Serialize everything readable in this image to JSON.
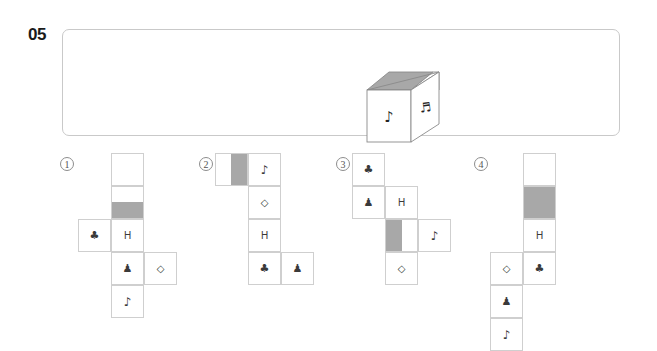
{
  "question": {
    "number": "05"
  },
  "stimulus": {
    "name": "cube-prompt",
    "cube": {
      "top_face_left_shade": "#a8a8a8",
      "top_face_right_shade": "#ffffff",
      "front_face_symbol": "♪",
      "front_face_symbol_name": "eighth-note",
      "right_face_symbol": "♬",
      "right_face_symbol_name": "beamed-notes",
      "outline_color": "#8a8a8a"
    }
  },
  "options": [
    {
      "label": "①",
      "name": "option-1",
      "cells": [
        {
          "col": 1,
          "row": 0,
          "fill": "white",
          "glyph": ""
        },
        {
          "col": 1,
          "row": 1,
          "fill": "gray-bottom",
          "glyph": ""
        },
        {
          "col": 0,
          "row": 2,
          "fill": "white",
          "glyph": "♣"
        },
        {
          "col": 1,
          "row": 2,
          "fill": "white",
          "glyph": "H"
        },
        {
          "col": 1,
          "row": 3,
          "fill": "white",
          "glyph": "♟"
        },
        {
          "col": 2,
          "row": 3,
          "fill": "white",
          "glyph": "◇"
        },
        {
          "col": 1,
          "row": 4,
          "fill": "white",
          "glyph": "♪"
        }
      ]
    },
    {
      "label": "②",
      "name": "option-2",
      "cells": [
        {
          "col": 0,
          "row": 0,
          "fill": "gray-right",
          "glyph": ""
        },
        {
          "col": 1,
          "row": 0,
          "fill": "white",
          "glyph": "♪"
        },
        {
          "col": 1,
          "row": 1,
          "fill": "white",
          "glyph": "◇"
        },
        {
          "col": 1,
          "row": 2,
          "fill": "white",
          "glyph": "H"
        },
        {
          "col": 1,
          "row": 3,
          "fill": "white",
          "glyph": "♣"
        },
        {
          "col": 2,
          "row": 3,
          "fill": "white",
          "glyph": "♟"
        }
      ]
    },
    {
      "label": "③",
      "name": "option-3",
      "cells": [
        {
          "col": 0,
          "row": 0,
          "fill": "white",
          "glyph": "♣"
        },
        {
          "col": 0,
          "row": 1,
          "fill": "white",
          "glyph": "♟"
        },
        {
          "col": 1,
          "row": 1,
          "fill": "white",
          "glyph": "H"
        },
        {
          "col": 1,
          "row": 2,
          "fill": "gray-left",
          "glyph": ""
        },
        {
          "col": 2,
          "row": 2,
          "fill": "white",
          "glyph": "♪"
        },
        {
          "col": 1,
          "row": 3,
          "fill": "white",
          "glyph": "◇"
        }
      ]
    },
    {
      "label": "④",
      "name": "option-4",
      "cells": [
        {
          "col": 1,
          "row": 0,
          "fill": "white",
          "glyph": ""
        },
        {
          "col": 1,
          "row": 1,
          "fill": "gray-full",
          "glyph": ""
        },
        {
          "col": 1,
          "row": 2,
          "fill": "white",
          "glyph": "H"
        },
        {
          "col": 0,
          "row": 3,
          "fill": "white",
          "glyph": "◇"
        },
        {
          "col": 1,
          "row": 3,
          "fill": "white",
          "glyph": "♣"
        },
        {
          "col": 0,
          "row": 4,
          "fill": "white",
          "glyph": "♟"
        },
        {
          "col": 0,
          "row": 5,
          "fill": "white",
          "glyph": "♪"
        }
      ]
    }
  ],
  "layout": {
    "cell_size": 33,
    "option_origins": [
      {
        "x": 78,
        "y": 153
      },
      {
        "x": 215,
        "y": 153
      },
      {
        "x": 352,
        "y": 153
      },
      {
        "x": 490,
        "y": 153
      }
    ],
    "label_positions": [
      {
        "x": 60,
        "y": 157
      },
      {
        "x": 199,
        "y": 157
      },
      {
        "x": 336,
        "y": 157
      },
      {
        "x": 474,
        "y": 157
      }
    ]
  },
  "colors": {
    "gray_fill": "#a8a8a8",
    "cell_border": "#cfcfcf",
    "panel_border": "#c9c9c9",
    "text": "#3a3a3a"
  }
}
